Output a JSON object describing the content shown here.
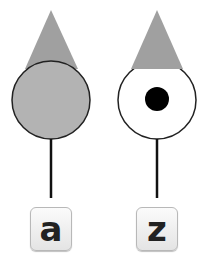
{
  "figures": [
    {
      "id": "left",
      "fill": "#b3b3b3",
      "triangle_fill": "#a0a0a0",
      "has_dot": false,
      "key_label": "a"
    },
    {
      "id": "right",
      "fill": "#ffffff",
      "triangle_fill": "#a0a0a0",
      "has_dot": true,
      "key_label": "z"
    }
  ],
  "colors": {
    "outline": "#222222",
    "dot": "#000000"
  }
}
